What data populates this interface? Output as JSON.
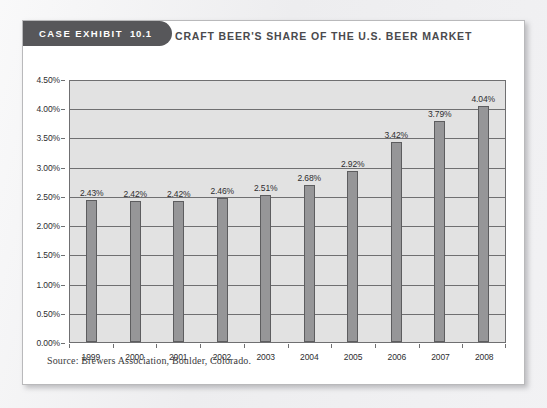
{
  "card": {
    "tab_label": "CASE EXHIBIT",
    "tab_number": "10.1",
    "title": "CRAFT BEER'S SHARE OF THE U.S. BEER MARKET",
    "source": "Source: Brewers Association, Boulder, Colorado."
  },
  "colors": {
    "tab_background": "#57575a",
    "tab_text": "#ffffff",
    "title_text": "#4a4a4d",
    "plot_background": "#e2e2e2",
    "plot_border": "#6f6f71",
    "bar_fill": "#969698",
    "bar_border": "#5d5d5f",
    "card_background": "#ffffff",
    "page_background": "#eeeef0"
  },
  "chart_data": {
    "type": "bar",
    "title": "CRAFT BEER'S SHARE OF THE U.S. BEER MARKET",
    "xlabel": "",
    "ylabel": "",
    "categories": [
      "1999",
      "2000",
      "2001",
      "2002",
      "2003",
      "2004",
      "2005",
      "2006",
      "2007",
      "2008"
    ],
    "values": [
      2.43,
      2.42,
      2.42,
      2.46,
      2.51,
      2.68,
      2.92,
      3.42,
      3.79,
      4.04
    ],
    "data_labels": [
      "2.43%",
      "2.42%",
      "2.42%",
      "2.46%",
      "2.51%",
      "2.68%",
      "2.92%",
      "3.42%",
      "3.79%",
      "4.04%"
    ],
    "ylim": [
      0,
      4.5
    ],
    "ytick_values": [
      4.5,
      4.0,
      3.5,
      3.0,
      2.5,
      2.0,
      1.5,
      1.0,
      0.5,
      0
    ],
    "ytick_labels": [
      "4.50%",
      "4.00%",
      "3.50%",
      "3.00%",
      "2.50%",
      "2.00%",
      "1.50%",
      "1.00%",
      "0.50%",
      "0.00%"
    ],
    "grid": true,
    "legend": false,
    "source": "Source: Brewers Association, Boulder, Colorado."
  }
}
